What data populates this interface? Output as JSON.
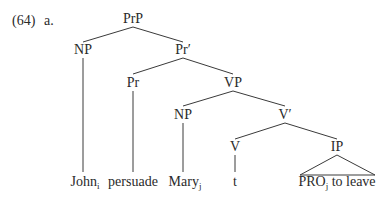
{
  "example": {
    "number": "(64)",
    "letter": "a."
  },
  "tree": {
    "nodes": {
      "PrP": "PrP",
      "NP_subject": "NP",
      "Pr_bar": "Pr′",
      "Pr": "Pr",
      "VP": "VP",
      "NP_object": "NP",
      "V_bar": "V′",
      "V": "V",
      "IP": "IP"
    },
    "leaves": {
      "john": {
        "word": "John",
        "index": "i"
      },
      "persuade": {
        "word": "persuade"
      },
      "mary": {
        "word": "Mary",
        "index": "j"
      },
      "trace": {
        "word": "t"
      },
      "pro": {
        "word": "PRO",
        "index": "j",
        "rest": " to leave"
      }
    }
  },
  "colors": {
    "text": "#2a2a2a",
    "lines": "#3a3a3a"
  }
}
